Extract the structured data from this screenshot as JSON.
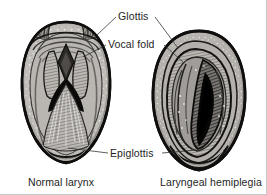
{
  "figure": {
    "width": 267,
    "height": 195,
    "background_color": "#ffffff",
    "ink_color": "#1e1e1e"
  },
  "annotations": [
    {
      "id": "glottis",
      "label": "Glottis",
      "x": 118,
      "y": 20
    },
    {
      "id": "vocal-fold",
      "label": "Vocal fold",
      "x": 108,
      "y": 48
    },
    {
      "id": "epiglottis",
      "label": "Epiglottis",
      "x": 110,
      "y": 157
    }
  ],
  "captions": [
    {
      "id": "normal-larynx",
      "label": "Normal larynx",
      "x": 28,
      "y": 186
    },
    {
      "id": "laryngeal-hemiplegia",
      "label": "Laryngeal hemiplegia",
      "x": 160,
      "y": 186
    }
  ],
  "specimens": [
    {
      "id": "normal-larynx",
      "name": "Normal larynx",
      "side": "left",
      "center_x": 66,
      "center_y": 88,
      "description": "Symmetric open rima glottidis with paired arytenoid cartilages and vocal folds forming an inverted V; epiglottis at ventral border",
      "palette": {
        "outline": "#141414",
        "mucosa_light": "#c9c6c2",
        "mucosa_mid": "#9d9a96",
        "mucosa_dark": "#6a6763",
        "airway": "#0d0d0d"
      }
    },
    {
      "id": "laryngeal-hemiplegia",
      "name": "Laryngeal hemiplegia",
      "side": "right",
      "center_x": 199,
      "center_y": 98,
      "description": "Asymmetric narrowed airway; left arytenoid collapsed across midline reducing the glottic aperture to a slit",
      "palette": {
        "outline": "#141414",
        "mucosa_light": "#cac7c3",
        "mucosa_mid": "#9b9894",
        "mucosa_dark": "#6a6763",
        "airway": "#0b0b0b"
      }
    }
  ],
  "leader_lines": [
    {
      "id": "glottis-to-left",
      "from": "glottis",
      "to": "normal-larynx"
    },
    {
      "id": "glottis-to-right",
      "from": "glottis",
      "to": "laryngeal-hemiplegia"
    },
    {
      "id": "vocalfold-to-left",
      "from": "vocal-fold",
      "to": "normal-larynx"
    },
    {
      "id": "vocalfold-to-right",
      "from": "vocal-fold",
      "to": "laryngeal-hemiplegia"
    },
    {
      "id": "epiglottis-to-left",
      "from": "epiglottis",
      "to": "normal-larynx"
    },
    {
      "id": "epiglottis-to-right",
      "from": "epiglottis",
      "to": "laryngeal-hemiplegia"
    }
  ]
}
